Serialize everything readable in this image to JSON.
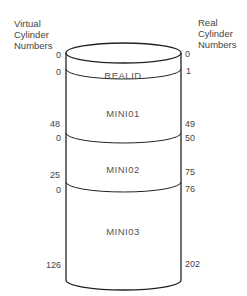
{
  "headers": {
    "left": "Virtual\nCylinder\nNumbers",
    "right": "Real\nCylinder\nNumbers"
  },
  "segments": [
    {
      "name": "REALID",
      "virtual_start": "0",
      "virtual_end": "0",
      "real_start": "0",
      "real_end": "1"
    },
    {
      "name": "MINI01",
      "virtual_start": "0",
      "virtual_end": "48",
      "real_start": "1",
      "real_end": "49"
    },
    {
      "name": "MINI02",
      "virtual_start": "0",
      "virtual_end": "25",
      "real_start": "50",
      "real_end": "75"
    },
    {
      "name": "MINI03",
      "virtual_start": "0",
      "virtual_end": "126",
      "real_start": "76",
      "real_end": "202"
    }
  ],
  "labels": {
    "left": [
      "0",
      "0",
      "48",
      "0",
      "25",
      "0",
      "126"
    ],
    "right": [
      "0",
      "1",
      "49",
      "50",
      "75",
      "76",
      "202"
    ]
  }
}
